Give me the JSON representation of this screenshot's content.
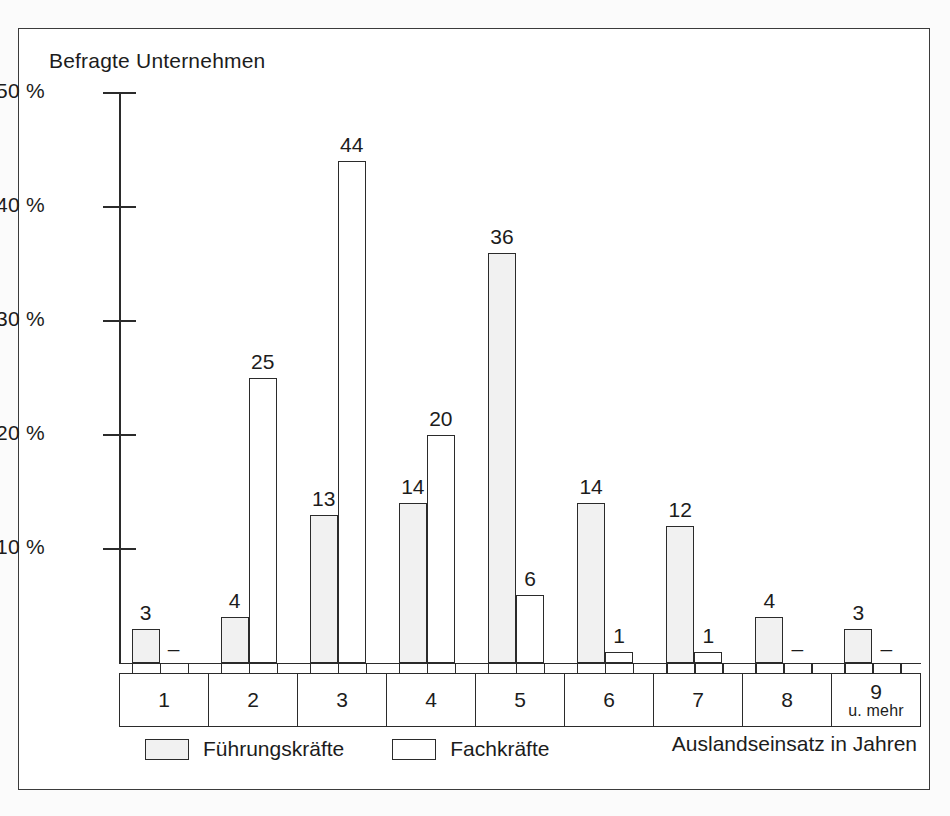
{
  "chart_data": {
    "type": "bar",
    "title": "",
    "ylabel": "Befragte Unternehmen",
    "xlabel": "Auslandseinsatz in Jahren",
    "categories": [
      "1",
      "2",
      "3",
      "4",
      "5",
      "6",
      "7",
      "8",
      "9"
    ],
    "category_sublabels": [
      "",
      "",
      "",
      "",
      "",
      "",
      "",
      "",
      "u. mehr"
    ],
    "ylim": [
      0,
      50
    ],
    "y_ticks": [
      10,
      20,
      30,
      40,
      50
    ],
    "y_tick_labels": [
      "10 %",
      "20 %",
      "30 %",
      "40 %",
      "50 %"
    ],
    "grid": false,
    "legend_position": "bottom-left",
    "series": [
      {
        "name": "Führungskräfte",
        "fill": "#f1f1f1",
        "values": [
          3,
          4,
          13,
          14,
          36,
          14,
          12,
          4,
          3
        ],
        "labels": [
          "3",
          "4",
          "13",
          "14",
          "36",
          "14",
          "12",
          "4",
          "3"
        ]
      },
      {
        "name": "Fachkräfte",
        "fill": "#ffffff",
        "values": [
          null,
          25,
          44,
          20,
          6,
          1,
          1,
          null,
          null
        ],
        "labels": [
          "–",
          "25",
          "44",
          "20",
          "6",
          "1",
          "1",
          "–",
          "–"
        ]
      }
    ]
  },
  "axes": {
    "y_title": "Befragte Unternehmen",
    "x_title": "Auslandseinsatz in Jahren",
    "y_tick_labels": [
      "50 %",
      "40 %",
      "30 %",
      "20 %",
      "10 %"
    ]
  },
  "legend": {
    "items": [
      {
        "label": "Führungskräfte",
        "style": "shaded"
      },
      {
        "label": "Fachkräfte",
        "style": "plain"
      }
    ]
  },
  "colors": {
    "ink": "#2b2b2b",
    "shaded_fill": "#f1f1f1",
    "plain_fill": "#ffffff",
    "page_background": "#fbfbfb",
    "frame_background": "#ffffff"
  }
}
